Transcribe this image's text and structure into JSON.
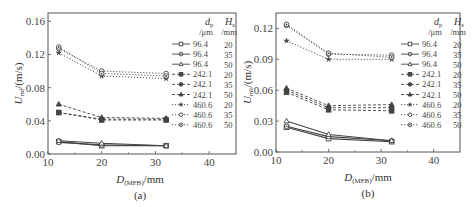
{
  "chart_data": [
    {
      "type": "line",
      "panel_label": "(a)",
      "xlabel": "D(MFB)/mm",
      "ylabel": "Umf/(m/s)",
      "xlim": [
        10,
        45
      ],
      "ylim": [
        0.0,
        0.17
      ],
      "xticks": [
        10,
        20,
        30,
        40
      ],
      "yticks": [
        0.0,
        0.04,
        0.08,
        0.12,
        0.16
      ],
      "ytick_labels": [
        "0.00",
        "0.04",
        "0.08",
        "0.12",
        "0.16"
      ],
      "legend_header": {
        "dp": "d_p",
        "hs": "H_s",
        "dp_unit": "/μm",
        "hs_unit": "/mm"
      },
      "x": [
        12,
        20,
        32
      ],
      "series": [
        {
          "name": "96.4 20",
          "dp": "96.4",
          "hs": "20",
          "marker": "square",
          "style": "solid",
          "values": [
            0.015,
            0.01,
            0.01
          ]
        },
        {
          "name": "96.4 35",
          "dp": "96.4",
          "hs": "35",
          "marker": "circle",
          "style": "solid",
          "values": [
            0.014,
            0.011,
            0.01
          ]
        },
        {
          "name": "96.4 50",
          "dp": "96.4",
          "hs": "50",
          "marker": "triangle",
          "style": "solid",
          "values": [
            0.016,
            0.013,
            0.01
          ]
        },
        {
          "name": "242.1 20",
          "dp": "242.1",
          "hs": "20",
          "marker": "square-filled",
          "style": "dashed",
          "values": [
            0.05,
            0.041,
            0.041
          ]
        },
        {
          "name": "242.1 35",
          "dp": "242.1",
          "hs": "35",
          "marker": "circle-filled",
          "style": "dashed",
          "values": [
            0.05,
            0.042,
            0.042
          ]
        },
        {
          "name": "242.1 50",
          "dp": "242.1",
          "hs": "50",
          "marker": "triangle-filled",
          "style": "dashed",
          "values": [
            0.06,
            0.044,
            0.043
          ]
        },
        {
          "name": "460.6 20",
          "dp": "460.6",
          "hs": "20",
          "marker": "star",
          "style": "dotted",
          "values": [
            0.122,
            0.094,
            0.091
          ]
        },
        {
          "name": "460.6 35",
          "dp": "460.6",
          "hs": "35",
          "marker": "circle-open",
          "style": "dotted",
          "values": [
            0.127,
            0.1,
            0.097
          ]
        },
        {
          "name": "460.6 50",
          "dp": "460.6",
          "hs": "50",
          "marker": "circle-dot",
          "style": "dotted",
          "values": [
            0.129,
            0.097,
            0.094
          ]
        }
      ]
    },
    {
      "type": "line",
      "panel_label": "(b)",
      "xlabel": "D(MFB)/mm",
      "ylabel": "Umb/(m/s)",
      "xlim": [
        10,
        45
      ],
      "ylim": [
        0.0,
        0.135
      ],
      "xticks": [
        10,
        20,
        30,
        40
      ],
      "yticks": [
        0.0,
        0.03,
        0.06,
        0.09,
        0.12
      ],
      "ytick_labels": [
        "0.00",
        "0.03",
        "0.06",
        "0.09",
        "0.12"
      ],
      "legend_header": {
        "dp": "d_p",
        "hs": "H_s",
        "dp_unit": "/μm",
        "hs_unit": "/mm"
      },
      "x": [
        12,
        20,
        32
      ],
      "series": [
        {
          "name": "96.4 20",
          "dp": "96.4",
          "hs": "20",
          "marker": "square",
          "style": "solid",
          "values": [
            0.024,
            0.013,
            0.01
          ]
        },
        {
          "name": "96.4 35",
          "dp": "96.4",
          "hs": "35",
          "marker": "circle",
          "style": "solid",
          "values": [
            0.025,
            0.015,
            0.011
          ]
        },
        {
          "name": "96.4 50",
          "dp": "96.4",
          "hs": "50",
          "marker": "triangle",
          "style": "solid",
          "values": [
            0.03,
            0.017,
            0.011
          ]
        },
        {
          "name": "242.1 20",
          "dp": "242.1",
          "hs": "20",
          "marker": "square-filled",
          "style": "dashed",
          "values": [
            0.058,
            0.041,
            0.04
          ]
        },
        {
          "name": "242.1 35",
          "dp": "242.1",
          "hs": "35",
          "marker": "circle-filled",
          "style": "dashed",
          "values": [
            0.06,
            0.043,
            0.043
          ]
        },
        {
          "name": "242.1 50",
          "dp": "242.1",
          "hs": "50",
          "marker": "triangle-filled",
          "style": "dashed",
          "values": [
            0.062,
            0.045,
            0.046
          ]
        },
        {
          "name": "460.6 20",
          "dp": "460.6",
          "hs": "20",
          "marker": "star",
          "style": "dotted",
          "values": [
            0.108,
            0.09,
            0.09
          ]
        },
        {
          "name": "460.6 35",
          "dp": "460.6",
          "hs": "35",
          "marker": "circle-open",
          "style": "dotted",
          "values": [
            0.123,
            0.095,
            0.094
          ]
        },
        {
          "name": "460.6 50",
          "dp": "460.6",
          "hs": "50",
          "marker": "circle-dot",
          "style": "dotted",
          "values": [
            0.124,
            0.096,
            0.092
          ]
        }
      ]
    }
  ]
}
